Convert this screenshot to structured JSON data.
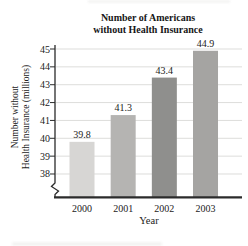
{
  "page": {
    "background": "#ffffff"
  },
  "chart": {
    "title_line1": "Number of Americans",
    "title_line2": "without Health Insurance",
    "ylabel_line1": "Number without",
    "ylabel_line2": "Health Insurance (millions)",
    "xlabel": "Year"
  },
  "chart_data": {
    "type": "bar",
    "title": "Number of Americans without Health Insurance",
    "xlabel": "Year",
    "ylabel": "Number without Health Insurance (millions)",
    "categories": [
      "2000",
      "2001",
      "2002",
      "2003"
    ],
    "values": [
      39.8,
      41.3,
      43.4,
      44.9
    ],
    "value_labels": [
      "39.8",
      "41.3",
      "43.4",
      "44.9"
    ],
    "bar_colors": [
      "#d7d6d4",
      "#b5b4b2",
      "#8f8f8d",
      "#a5a4a2"
    ],
    "y_ticks": [
      45,
      44,
      43,
      42,
      41,
      40,
      39,
      38
    ],
    "ylim": [
      38,
      45
    ],
    "axis_break": true,
    "grid": "horizontal",
    "gridline_color": "#dddddb",
    "axis_color": "#2b2b2b",
    "legend": "none"
  }
}
